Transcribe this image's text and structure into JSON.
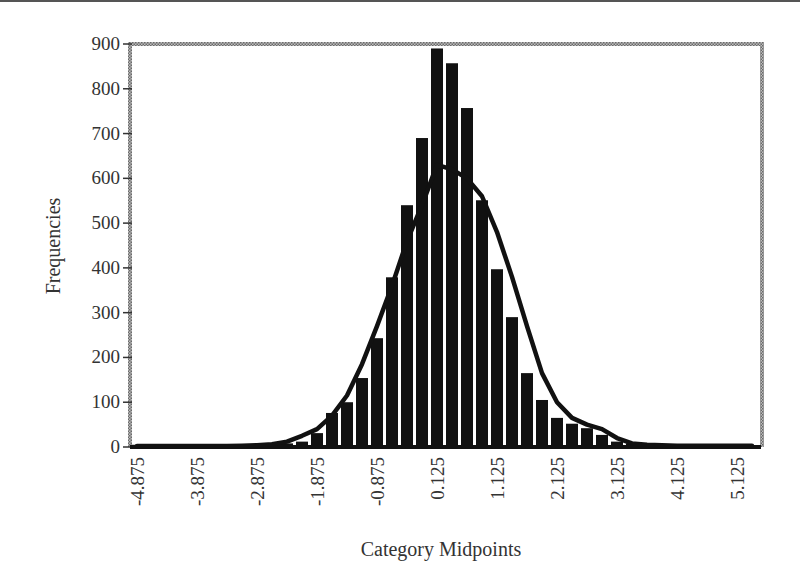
{
  "chart_data": {
    "type": "bar",
    "title": "",
    "xlabel": "Category Midpoints",
    "ylabel": "Frequencies",
    "ylim": [
      0,
      900
    ],
    "yticks": [
      0,
      100,
      200,
      300,
      400,
      500,
      600,
      700,
      800,
      900
    ],
    "xtick_labels": [
      "-4.875",
      "-3.875",
      "-2.875",
      "-1.875",
      "-0.875",
      "0.125",
      "1.125",
      "2.125",
      "3.125",
      "4.125",
      "5.125"
    ],
    "grid": false,
    "legend": null,
    "categories": [
      -4.875,
      -4.625,
      -4.375,
      -4.125,
      -3.875,
      -3.625,
      -3.375,
      -3.125,
      -2.875,
      -2.625,
      -2.375,
      -2.125,
      -1.875,
      -1.625,
      -1.375,
      -1.125,
      -0.875,
      -0.625,
      -0.375,
      -0.125,
      0.125,
      0.375,
      0.625,
      0.875,
      1.125,
      1.375,
      1.625,
      1.875,
      2.125,
      2.375,
      2.625,
      2.875,
      3.125,
      3.375,
      3.625,
      3.875,
      4.125,
      4.375,
      4.625,
      4.875,
      5.125,
      5.375
    ],
    "series": [
      {
        "name": "Frequencies (histogram)",
        "kind": "bar",
        "values": [
          5,
          3,
          4,
          2,
          3,
          4,
          3,
          5,
          5,
          6,
          8,
          12,
          31,
          76,
          100,
          154,
          243,
          379,
          540,
          690,
          890,
          857,
          757,
          551,
          397,
          290,
          165,
          105,
          65,
          52,
          42,
          27,
          12,
          8,
          6,
          5,
          5,
          4,
          3,
          3,
          3,
          3
        ]
      },
      {
        "name": "Normal curve",
        "kind": "line",
        "values": [
          2,
          2,
          2,
          2,
          2,
          2,
          2,
          3,
          4,
          6,
          12,
          25,
          40,
          70,
          115,
          185,
          270,
          360,
          460,
          540,
          630,
          620,
          600,
          560,
          480,
          380,
          270,
          165,
          100,
          65,
          50,
          40,
          20,
          8,
          5,
          4,
          3,
          3,
          3,
          3,
          3,
          3
        ]
      }
    ]
  }
}
